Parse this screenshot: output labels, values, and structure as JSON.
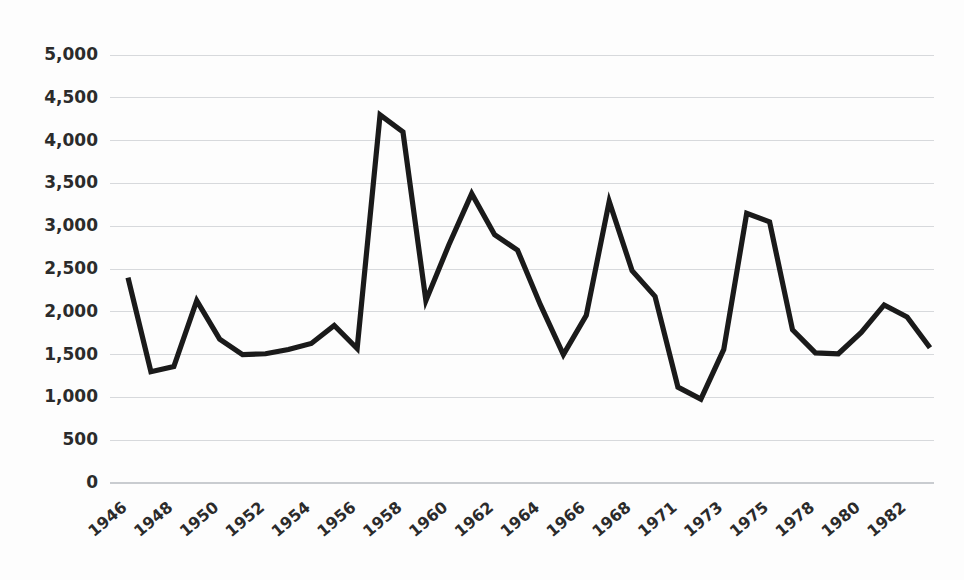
{
  "chart_data": {
    "type": "line",
    "title": "",
    "subtitle": "",
    "xlabel": "",
    "ylabel": "",
    "grid": true,
    "legend": "none",
    "ylim": [
      0,
      5000
    ],
    "ytick_labels": [
      "5,000",
      "4,500",
      "4,000",
      "3,500",
      "3,000",
      "2,500",
      "2,000",
      "1,500",
      "1,000",
      "500",
      "0"
    ],
    "ytick_values": [
      5000,
      4500,
      4000,
      3500,
      3000,
      2500,
      2000,
      1500,
      1000,
      500,
      0
    ],
    "xtick_labels": [
      "1946",
      "1948",
      "1950",
      "1952",
      "1954",
      "1956",
      "1958",
      "1960",
      "1962",
      "1964",
      "1966",
      "1968",
      "1971",
      "1973",
      "1975",
      "1978",
      "1980",
      "1982"
    ],
    "categories": [
      "1946",
      "1947",
      "1948",
      "1949",
      "1950",
      "1951",
      "1952",
      "1953",
      "1954",
      "1955",
      "1956",
      "1957",
      "1958",
      "1959",
      "1960",
      "1961",
      "1962",
      "1963",
      "1964",
      "1965",
      "1966",
      "1967",
      "1968",
      "1970",
      "1971",
      "1972",
      "1973",
      "1974",
      "1975",
      "1976",
      "1978",
      "1979",
      "1980",
      "1981",
      "1982",
      "1983"
    ],
    "values": [
      2400,
      1300,
      1360,
      2130,
      1680,
      1500,
      1510,
      1560,
      1630,
      1840,
      1570,
      4300,
      4100,
      2130,
      2780,
      3380,
      2900,
      2720,
      2080,
      1500,
      1960,
      3290,
      2480,
      2180,
      1120,
      980,
      1560,
      3150,
      3050,
      1790,
      1520,
      1510,
      1760,
      2080,
      1940,
      1580
    ],
    "series_color": "#1a1a1a",
    "grid_color": "#d7d9dc",
    "background_color": "#fdfdfd"
  }
}
